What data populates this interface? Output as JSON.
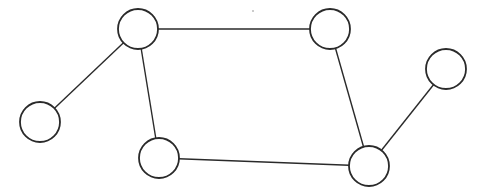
{
  "diagram": {
    "type": "undirected-graph",
    "node_radius": 20,
    "colors": {
      "stroke": "#2a2a2a",
      "fill": "#ffffff",
      "background": "#ffffff"
    },
    "nodes": [
      {
        "id": "n1",
        "x": 138,
        "y": 29
      },
      {
        "id": "n2",
        "x": 330,
        "y": 29
      },
      {
        "id": "n3",
        "x": 446,
        "y": 69
      },
      {
        "id": "n4",
        "x": 40,
        "y": 122
      },
      {
        "id": "n5",
        "x": 159,
        "y": 158
      },
      {
        "id": "n6",
        "x": 369,
        "y": 166
      }
    ],
    "edges": [
      {
        "from": "n1",
        "to": "n2"
      },
      {
        "from": "n1",
        "to": "n4"
      },
      {
        "from": "n1",
        "to": "n5"
      },
      {
        "from": "n2",
        "to": "n6"
      },
      {
        "from": "n5",
        "to": "n6"
      },
      {
        "from": "n6",
        "to": "n3"
      }
    ],
    "artifacts": [
      {
        "x": 253,
        "y": 11,
        "r": 0.8
      }
    ]
  }
}
